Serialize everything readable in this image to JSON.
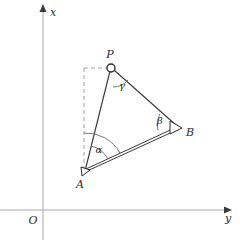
{
  "figure": {
    "kind": "geometry-diagram",
    "background_color": "#ffffff",
    "stroke_color": "#2b2b2b",
    "axis_color": "#9a9a9a",
    "dashed_color": "#9a9a9a"
  },
  "axes": {
    "origin_label": "O",
    "vertical_axis_label": "x",
    "horizontal_axis_label": "y",
    "origin": {
      "x": 43,
      "y": 210
    },
    "vertical_axis": {
      "x": 43,
      "y_top": 10,
      "y_bottom": 240
    },
    "horizontal_axis": {
      "y": 210,
      "x_left": 0,
      "x_right": 226
    }
  },
  "points": [
    {
      "name": "P",
      "label": "P",
      "x": 111,
      "y": 68,
      "marker": "circle",
      "label_x": 110,
      "label_y": 58
    },
    {
      "name": "B",
      "label": "B",
      "x": 178,
      "y": 128,
      "marker": "triangle",
      "label_x": 190,
      "label_y": 135
    },
    {
      "name": "A",
      "label": "A",
      "x": 85,
      "y": 172,
      "marker": "triangle",
      "label_x": 80,
      "label_y": 187
    }
  ],
  "angles": [
    {
      "name": "alpha",
      "label": "α",
      "at_point": "A",
      "label_x": 98,
      "label_y": 152
    },
    {
      "name": "beta",
      "label": "β",
      "at_point": "B",
      "label_x": 160,
      "label_y": 122
    },
    {
      "name": "gamma",
      "label": "γ",
      "at_point": "P",
      "label_x": 121,
      "label_y": 88
    }
  ],
  "segments": [
    {
      "name": "segment-AP",
      "from": "A",
      "to": "P",
      "style": "solid"
    },
    {
      "name": "segment-PB",
      "from": "P",
      "to": "B",
      "style": "solid"
    },
    {
      "name": "segment-AB",
      "from": "A",
      "to": "B",
      "style": "double"
    }
  ],
  "guides": [
    {
      "name": "vertical-dashed-guide",
      "x1": 84,
      "y1": 68,
      "x2": 84,
      "y2": 171,
      "style": "dashed"
    },
    {
      "name": "horizontal-dashed-guide",
      "x1": 84,
      "y1": 68,
      "x2": 107,
      "y2": 68,
      "style": "dashed"
    }
  ]
}
